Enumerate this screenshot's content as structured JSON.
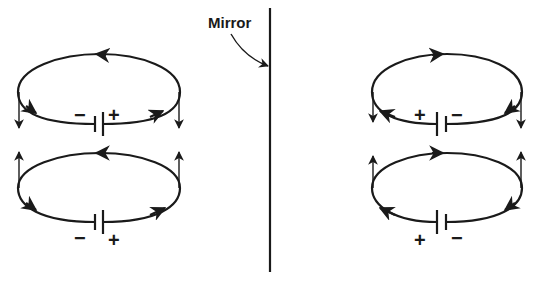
{
  "figure": {
    "mirror": {
      "label": "Mirror"
    },
    "left_side": {
      "top_loop": {
        "battery": {
          "left_sign": "−",
          "right_sign": "+"
        },
        "current_top": "leftward",
        "current_bottom": "rightward",
        "moment_arrows": "down"
      },
      "bottom_loop": {
        "battery": {
          "left_sign": "−",
          "right_sign": "+"
        },
        "current_top": "leftward",
        "current_bottom": "rightward",
        "moment_arrows": "up"
      }
    },
    "right_side": {
      "top_loop": {
        "battery": {
          "left_sign": "+",
          "right_sign": "−"
        },
        "current_top": "rightward",
        "current_bottom": "leftward",
        "moment_arrows": "down"
      },
      "bottom_loop": {
        "battery": {
          "left_sign": "+",
          "right_sign": "−"
        },
        "current_top": "rightward",
        "current_bottom": "leftward",
        "moment_arrows": "up"
      }
    },
    "colors": {
      "ink": "#1a1a1a",
      "background": "#ffffff"
    }
  }
}
